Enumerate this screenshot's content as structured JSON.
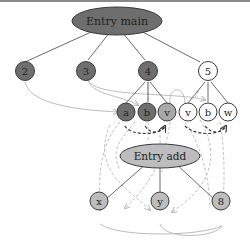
{
  "diagram": {
    "colors": {
      "dark_node": "#6e6e6e",
      "mid_node": "#a8a8a8",
      "light_node": "#bdbdbd",
      "white_node": "#ffffff",
      "stroke": "#3a3a3a",
      "solid_edge": "#6a6a6a",
      "dashed_dark": "#3a3a3a",
      "dashed_light": "#c0c0c0",
      "curve_light": "#bcbcbc"
    },
    "nodes": {
      "entry_main": {
        "label": "Entry main"
      },
      "n2": {
        "label": "2"
      },
      "n3": {
        "label": "3"
      },
      "n4": {
        "label": "4"
      },
      "n5": {
        "label": "5"
      },
      "a": {
        "label": "a"
      },
      "b1": {
        "label": "b"
      },
      "v1": {
        "label": "v"
      },
      "v2": {
        "label": "v"
      },
      "b2": {
        "label": "b"
      },
      "w": {
        "label": "w"
      },
      "entry_add": {
        "label": "Entry add"
      },
      "x": {
        "label": "x"
      },
      "y": {
        "label": "y"
      },
      "n8": {
        "label": "8"
      }
    }
  }
}
